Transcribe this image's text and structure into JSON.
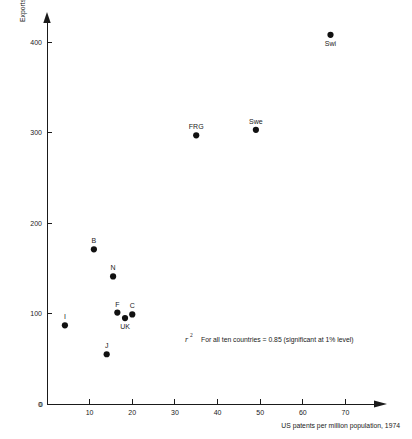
{
  "chart_data": {
    "type": "scatter",
    "title": "",
    "xlabel": "US patents per million population, 1974",
    "ylabel": "Exports (US $) per head, 1974",
    "xlim": [
      0,
      76
    ],
    "ylim": [
      0,
      420
    ],
    "xticks": [
      0,
      10,
      20,
      30,
      40,
      50,
      60,
      70
    ],
    "yticks": [
      0,
      100,
      200,
      300,
      400
    ],
    "grid": false,
    "legend": false,
    "annotation": {
      "symbol": "r",
      "superscript": "2",
      "text": "For all ten countries = 0.85 (significant at 1% level)"
    },
    "points": [
      {
        "label": "Swi",
        "x": 66.5,
        "y": 408,
        "label_pos": "below"
      },
      {
        "label": "Swe",
        "x": 49.0,
        "y": 303,
        "label_pos": "above"
      },
      {
        "label": "FRG",
        "x": 35.0,
        "y": 297,
        "label_pos": "above"
      },
      {
        "label": "B",
        "x": 11.0,
        "y": 171,
        "label_pos": "above"
      },
      {
        "label": "N",
        "x": 15.5,
        "y": 141,
        "label_pos": "above"
      },
      {
        "label": "F",
        "x": 16.5,
        "y": 101,
        "label_pos": "above"
      },
      {
        "label": "UK",
        "x": 18.3,
        "y": 95,
        "label_pos": "below"
      },
      {
        "label": "C",
        "x": 20.0,
        "y": 99,
        "label_pos": "above"
      },
      {
        "label": "I",
        "x": 4.2,
        "y": 87,
        "label_pos": "above"
      },
      {
        "label": "J",
        "x": 14.0,
        "y": 55,
        "label_pos": "above"
      }
    ]
  }
}
